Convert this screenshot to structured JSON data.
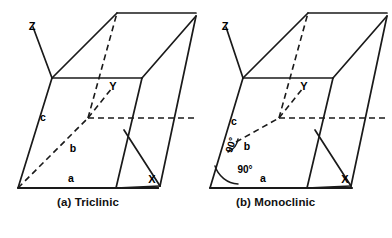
{
  "figure": {
    "background_color": "#ffffff",
    "line_color": "#1a1a1a"
  },
  "panels": [
    {
      "id": "triclinic",
      "caption": "(a) Triclinic",
      "axes": [
        {
          "name": "axis-z",
          "label": "Z"
        },
        {
          "name": "axis-y",
          "label": "Y"
        },
        {
          "name": "axis-x",
          "label": "X"
        }
      ],
      "edges": [
        {
          "name": "edge-a",
          "label": "a"
        },
        {
          "name": "edge-b",
          "label": "b"
        },
        {
          "name": "edge-c",
          "label": "c"
        }
      ],
      "angles": []
    },
    {
      "id": "monoclinic",
      "caption": "(b) Monoclinic",
      "axes": [
        {
          "name": "axis-z",
          "label": "Z"
        },
        {
          "name": "axis-y",
          "label": "Y"
        },
        {
          "name": "axis-x",
          "label": "X"
        }
      ],
      "edges": [
        {
          "name": "edge-a",
          "label": "a"
        },
        {
          "name": "edge-b",
          "label": "b"
        },
        {
          "name": "edge-c",
          "label": "c"
        }
      ],
      "angles": [
        {
          "name": "angle-c-b",
          "label": "90°"
        },
        {
          "name": "angle-c-a",
          "label": "90°"
        }
      ]
    }
  ]
}
